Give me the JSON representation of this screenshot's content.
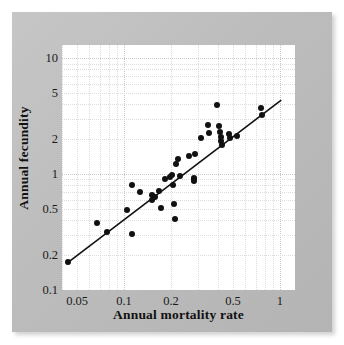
{
  "figure": {
    "background_color": "#ffffff",
    "card_color": "#bebebe",
    "panel_color": "#ffffff",
    "point_color": "#111111",
    "line_color": "#111111"
  },
  "chart_data": {
    "type": "scatter",
    "title": "",
    "xlabel": "Annual mortality rate",
    "ylabel": "Annual fecundity",
    "xscale": "log",
    "yscale": "log",
    "xlim": [
      0.04,
      1.25
    ],
    "ylim": [
      0.1,
      13.0
    ],
    "grid": true,
    "legend": "none",
    "xticks": [
      0.05,
      0.1,
      0.2,
      0.5,
      1
    ],
    "xticklabels": [
      "0.05",
      "0.1",
      "0.2",
      "0.5",
      "1"
    ],
    "yticks": [
      0.1,
      0.2,
      0.5,
      1,
      2,
      5,
      10
    ],
    "yticklabels": [
      "0.1",
      "0.2",
      "0.5",
      "1",
      "2",
      "5",
      "10"
    ],
    "points": [
      {
        "x": 0.044,
        "y": 0.175
      },
      {
        "x": 0.067,
        "y": 0.38
      },
      {
        "x": 0.078,
        "y": 0.315
      },
      {
        "x": 0.105,
        "y": 0.49
      },
      {
        "x": 0.112,
        "y": 0.8
      },
      {
        "x": 0.113,
        "y": 0.305
      },
      {
        "x": 0.127,
        "y": 0.7
      },
      {
        "x": 0.152,
        "y": 0.6
      },
      {
        "x": 0.158,
        "y": 0.64
      },
      {
        "x": 0.168,
        "y": 0.72
      },
      {
        "x": 0.172,
        "y": 0.51
      },
      {
        "x": 0.183,
        "y": 0.9
      },
      {
        "x": 0.196,
        "y": 0.95
      },
      {
        "x": 0.203,
        "y": 0.98
      },
      {
        "x": 0.206,
        "y": 0.8
      },
      {
        "x": 0.209,
        "y": 0.55
      },
      {
        "x": 0.212,
        "y": 0.41
      },
      {
        "x": 0.215,
        "y": 1.22
      },
      {
        "x": 0.222,
        "y": 1.35
      },
      {
        "x": 0.228,
        "y": 0.97
      },
      {
        "x": 0.262,
        "y": 1.42
      },
      {
        "x": 0.281,
        "y": 0.93
      },
      {
        "x": 0.282,
        "y": 0.88
      },
      {
        "x": 0.286,
        "y": 1.5
      },
      {
        "x": 0.312,
        "y": 2.05
      },
      {
        "x": 0.345,
        "y": 2.65
      },
      {
        "x": 0.352,
        "y": 2.25
      },
      {
        "x": 0.392,
        "y": 3.95
      },
      {
        "x": 0.408,
        "y": 2.6
      },
      {
        "x": 0.412,
        "y": 2.3
      },
      {
        "x": 0.418,
        "y": 2.1
      },
      {
        "x": 0.422,
        "y": 1.92
      },
      {
        "x": 0.425,
        "y": 1.78
      },
      {
        "x": 0.468,
        "y": 2.2
      },
      {
        "x": 0.475,
        "y": 2.05
      },
      {
        "x": 0.53,
        "y": 2.15
      },
      {
        "x": 0.76,
        "y": 3.7
      },
      {
        "x": 0.772,
        "y": 3.25
      },
      {
        "x": 0.152,
        "y": 0.665
      },
      {
        "x": 0.283,
        "y": 0.915
      }
    ],
    "fit_line": {
      "x_start": 0.0425,
      "y_start": 0.168,
      "x_end": 1.02,
      "y_end": 4.35,
      "description": "fitted regression line"
    }
  }
}
